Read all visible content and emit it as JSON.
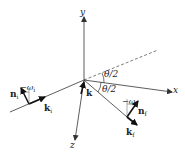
{
  "diagram": {
    "type": "scattering-geometry",
    "axes": {
      "x": "x",
      "y": "y",
      "z": "z"
    },
    "angles": {
      "upper": "θ/2",
      "lower": "θ/2"
    },
    "vectors": {
      "k": "k",
      "n_i": {
        "base": "n",
        "sub": "i"
      },
      "k_i": {
        "base": "k",
        "sub": "i"
      },
      "n_f": {
        "base": "n",
        "sub": "f"
      },
      "k_f": {
        "base": "k",
        "sub": "f"
      }
    },
    "rotations": {
      "omega_i": {
        "base": "−ω",
        "sub": "i"
      },
      "omega_f": {
        "base": "−ω",
        "sub": "f"
      }
    },
    "colors": {
      "line": "#333333",
      "background": "#ffffff"
    }
  }
}
